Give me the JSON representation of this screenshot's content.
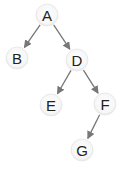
{
  "diagram": {
    "type": "binary-tree",
    "colors": {
      "edge": "#777777",
      "node_fill": "#f7f7f7",
      "node_stroke": "#e4e4e4",
      "label": "#222222"
    },
    "nodes": [
      {
        "id": "A",
        "label": "A",
        "x": 47,
        "y": 15
      },
      {
        "id": "B",
        "label": "B",
        "x": 17,
        "y": 58
      },
      {
        "id": "D",
        "label": "D",
        "x": 77,
        "y": 60
      },
      {
        "id": "E",
        "label": "E",
        "x": 51,
        "y": 105
      },
      {
        "id": "F",
        "label": "F",
        "x": 105,
        "y": 104
      },
      {
        "id": "G",
        "label": "G",
        "x": 82,
        "y": 150
      }
    ],
    "edges": [
      {
        "from": "A",
        "to": "B"
      },
      {
        "from": "A",
        "to": "D"
      },
      {
        "from": "D",
        "to": "E"
      },
      {
        "from": "D",
        "to": "F"
      },
      {
        "from": "F",
        "to": "G"
      }
    ]
  }
}
